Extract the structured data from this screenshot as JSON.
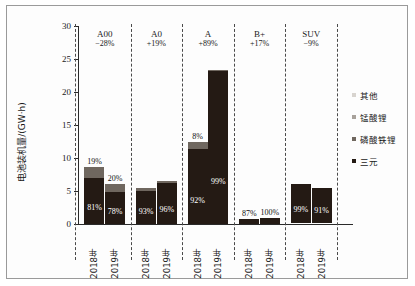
{
  "chart_data": {
    "type": "bar",
    "title": "",
    "xlabel": "",
    "ylabel": "电池装机量/(GW·h)",
    "ylim": [
      0,
      30
    ],
    "yticks": [
      0,
      5,
      10,
      15,
      20,
      25,
      30
    ],
    "grid": false,
    "legend_position": "right",
    "stacked": true,
    "legend": [
      {
        "name": "其他",
        "color": "#d8d4cf"
      },
      {
        "name": "锰酸锂",
        "color": "#a8a29b"
      },
      {
        "name": "磷酸铁锂",
        "color": "#6f675f"
      },
      {
        "name": "三元",
        "color": "#241a14"
      }
    ],
    "groups": [
      {
        "name": "A00",
        "change": "−28%",
        "bars": [
          {
            "x": "2018年",
            "total": 8.6,
            "segments": [
              {
                "series": "三元",
                "value": 7.0,
                "label": "81%"
              },
              {
                "series": "磷酸铁锂",
                "value": 1.6,
                "label": "19%"
              }
            ]
          },
          {
            "x": "2019年",
            "total": 6.1,
            "segments": [
              {
                "series": "三元",
                "value": 4.8,
                "label": "78%"
              },
              {
                "series": "磷酸铁锂",
                "value": 1.3,
                "label": "20%"
              }
            ]
          }
        ]
      },
      {
        "name": "A0",
        "change": "+19%",
        "bars": [
          {
            "x": "2018年",
            "total": 5.4,
            "segments": [
              {
                "series": "三元",
                "value": 5.0,
                "label": "93%"
              },
              {
                "series": "磷酸铁锂",
                "value": 0.4,
                "label": ""
              }
            ]
          },
          {
            "x": "2019年",
            "total": 6.5,
            "segments": [
              {
                "series": "三元",
                "value": 6.2,
                "label": "96%"
              },
              {
                "series": "磷酸铁锂",
                "value": 0.3,
                "label": ""
              }
            ]
          }
        ]
      },
      {
        "name": "A",
        "change": "+89%",
        "bars": [
          {
            "x": "2018年",
            "total": 12.4,
            "segments": [
              {
                "series": "三元",
                "value": 11.4,
                "label": "92%"
              },
              {
                "series": "磷酸铁锂",
                "value": 1.0,
                "label": "8%"
              }
            ]
          },
          {
            "x": "2019年",
            "total": 23.4,
            "segments": [
              {
                "series": "三元",
                "value": 23.2,
                "label": "99%"
              },
              {
                "series": "磷酸铁锂",
                "value": 0.2,
                "label": ""
              }
            ]
          }
        ]
      },
      {
        "name": "B+",
        "change": "+17%",
        "bars": [
          {
            "x": "2018年",
            "total": 0.7,
            "segments": [
              {
                "series": "三元",
                "value": 0.7,
                "label": "87%"
              }
            ]
          },
          {
            "x": "2019年",
            "total": 0.9,
            "segments": [
              {
                "series": "三元",
                "value": 0.9,
                "label": "100%"
              }
            ]
          }
        ]
      },
      {
        "name": "SUV",
        "change": "−9%",
        "bars": [
          {
            "x": "2018年",
            "total": 6.0,
            "segments": [
              {
                "series": "三元",
                "value": 5.9,
                "label": "99%"
              }
            ]
          },
          {
            "x": "2019年",
            "total": 5.4,
            "segments": [
              {
                "series": "三元",
                "value": 5.2,
                "label": "91%"
              }
            ]
          }
        ]
      }
    ]
  }
}
